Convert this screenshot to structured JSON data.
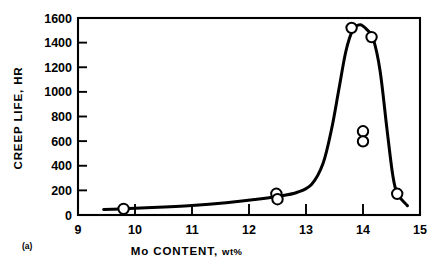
{
  "figure": {
    "panel_label": "(a)"
  },
  "chart_data": {
    "type": "scatter",
    "title": "",
    "xlabel_main": "Mo CONTENT,",
    "xlabel_unit": "wt%",
    "ylabel": "CREEP LIFE, HR",
    "xlim": [
      9,
      15
    ],
    "ylim": [
      0,
      1600
    ],
    "xticks": [
      9,
      10,
      11,
      12,
      13,
      14,
      15
    ],
    "xtick_labels": [
      "9",
      "10",
      "11",
      "12",
      "13",
      "14",
      "15"
    ],
    "yticks": [
      0,
      200,
      400,
      600,
      800,
      1000,
      1200,
      1400,
      1600
    ],
    "ytick_labels": [
      "0",
      "200",
      "400",
      "600",
      "800",
      "1000",
      "1200",
      "1400",
      "1600"
    ],
    "grid": false,
    "legend": null,
    "marker_style": "open-circle",
    "points": [
      {
        "x": 9.8,
        "y": 50,
        "label": "9.8 wt%, 50 hr"
      },
      {
        "x": 12.48,
        "y": 172,
        "label": "12.48 wt%, 172 hr"
      },
      {
        "x": 12.5,
        "y": 128,
        "label": "12.5 wt%, 128 hr"
      },
      {
        "x": 13.8,
        "y": 1520,
        "label": "13.8 wt%, 1520 hr"
      },
      {
        "x": 14.15,
        "y": 1445,
        "label": "14.15 wt%, 1445 hr"
      },
      {
        "x": 14.0,
        "y": 680,
        "label": "14.0 wt%, 680 hr"
      },
      {
        "x": 14.0,
        "y": 598,
        "label": "14.0 wt%, 598 hr"
      },
      {
        "x": 14.6,
        "y": 172,
        "label": "14.6 wt%, 172 hr"
      }
    ],
    "curve": [
      {
        "x": 9.45,
        "y": 45
      },
      {
        "x": 9.8,
        "y": 50
      },
      {
        "x": 10.3,
        "y": 60
      },
      {
        "x": 11.0,
        "y": 78
      },
      {
        "x": 11.6,
        "y": 100
      },
      {
        "x": 12.1,
        "y": 125
      },
      {
        "x": 12.5,
        "y": 150
      },
      {
        "x": 12.85,
        "y": 185
      },
      {
        "x": 13.1,
        "y": 250
      },
      {
        "x": 13.3,
        "y": 420
      },
      {
        "x": 13.45,
        "y": 700
      },
      {
        "x": 13.58,
        "y": 1030
      },
      {
        "x": 13.7,
        "y": 1330
      },
      {
        "x": 13.82,
        "y": 1500
      },
      {
        "x": 13.95,
        "y": 1545
      },
      {
        "x": 14.08,
        "y": 1500
      },
      {
        "x": 14.18,
        "y": 1430
      },
      {
        "x": 14.3,
        "y": 1170
      },
      {
        "x": 14.42,
        "y": 700
      },
      {
        "x": 14.52,
        "y": 330
      },
      {
        "x": 14.6,
        "y": 175
      },
      {
        "x": 14.78,
        "y": 75
      }
    ]
  }
}
